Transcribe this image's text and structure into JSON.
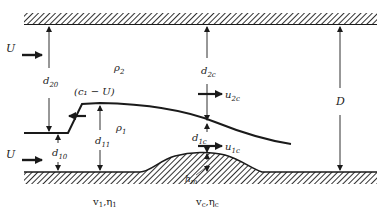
{
  "diagram": {
    "labels": {
      "U_top": "U",
      "U_bottom": "U",
      "d20": {
        "base": "d",
        "sub": "20"
      },
      "d10": {
        "base": "d",
        "sub": "10"
      },
      "d11": {
        "base": "d",
        "sub": "11"
      },
      "d2c": {
        "base": "d",
        "sub": "2c"
      },
      "d1c": {
        "base": "d",
        "sub": "1c"
      },
      "u2c": {
        "base": "u",
        "sub": "2c"
      },
      "u1c": {
        "base": "u",
        "sub": "1c"
      },
      "rho2": {
        "base": "ρ",
        "sub": "2"
      },
      "rho1": {
        "base": "ρ",
        "sub": "1"
      },
      "c1U": "(c₁ − U)",
      "D": "D",
      "hm": {
        "base": "h",
        "sub": "m"
      },
      "v1eta1": {
        "a": "v",
        "asub": "1",
        "b": "η",
        "bsub": "1"
      },
      "vceta_c": {
        "a": "v",
        "asub": "c",
        "b": "η",
        "bsub": "c"
      }
    },
    "colors": {
      "line": "#1a1a1a",
      "background": "#ffffff"
    }
  }
}
